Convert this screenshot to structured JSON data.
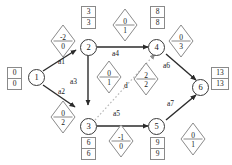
{
  "diagram": {
    "type": "activity-network",
    "nodes": [
      {
        "id": "n1",
        "label": "1",
        "x": 28,
        "y": 77
      },
      {
        "id": "n2",
        "label": "2",
        "x": 80,
        "y": 39
      },
      {
        "id": "n3",
        "label": "3",
        "x": 80,
        "y": 118
      },
      {
        "id": "n4",
        "label": "4",
        "x": 152,
        "y": 39
      },
      {
        "id": "n5",
        "label": "5",
        "x": 152,
        "y": 118
      },
      {
        "id": "n6",
        "label": "6",
        "x": 196,
        "y": 78
      }
    ],
    "time_boxes": [
      {
        "for": "n1",
        "early": "0",
        "late": "0",
        "x": 7,
        "y": 72
      },
      {
        "for": "n2",
        "early": "3",
        "late": "3",
        "x": 82,
        "y": 8
      },
      {
        "for": "n4",
        "early": "8",
        "late": "8",
        "x": 152,
        "y": 8
      },
      {
        "for": "n6",
        "early": "13",
        "late": "13",
        "x": 213,
        "y": 72
      },
      {
        "for": "n3",
        "early": "6",
        "late": "6",
        "x": 82,
        "y": 137
      },
      {
        "for": "n5",
        "early": "9",
        "late": "9",
        "x": 152,
        "y": 137
      }
    ],
    "edges": [
      {
        "id": "a1",
        "from": "n1",
        "to": "n2",
        "label": "a1",
        "label_x": 58,
        "label_y": 63,
        "style": "solid"
      },
      {
        "id": "a2",
        "from": "n1",
        "to": "n3",
        "label": "a2",
        "label_x": 58,
        "label_y": 92,
        "style": "solid"
      },
      {
        "id": "a3",
        "from": "n2",
        "to": "n3",
        "label": "a3",
        "label_x": 72,
        "label_y": 81,
        "style": "solid"
      },
      {
        "id": "a4",
        "from": "n2",
        "to": "n4",
        "label": "a4",
        "label_x": 112,
        "label_y": 53,
        "style": "solid"
      },
      {
        "id": "a5",
        "from": "n3",
        "to": "n5",
        "label": "a5",
        "label_x": 113,
        "label_y": 112,
        "style": "solid"
      },
      {
        "id": "a6",
        "from": "n4",
        "to": "n6",
        "label": "a6",
        "label_x": 164,
        "label_y": 65,
        "style": "solid"
      },
      {
        "id": "a7",
        "from": "n5",
        "to": "n6",
        "label": "a7",
        "label_x": 168,
        "label_y": 100,
        "style": "solid"
      },
      {
        "id": "d",
        "from": "n3",
        "to": "n4",
        "label": "d",
        "label_x": 117,
        "label_y": 85,
        "style": "dotted"
      }
    ],
    "float_diamonds": [
      {
        "for": "a1",
        "num": "-2",
        "den": "0",
        "x": 50,
        "y": 24
      },
      {
        "for": "a4",
        "num": "0",
        "den": "1",
        "x": 112,
        "y": 8
      },
      {
        "for": "a6",
        "num": "0",
        "den": "3",
        "x": 168,
        "y": 24
      },
      {
        "for": "a3",
        "num": "0",
        "den": "1",
        "x": 96,
        "y": 60
      },
      {
        "for": "d",
        "num": "2",
        "den": "2",
        "x": 133,
        "y": 62
      },
      {
        "for": "a2",
        "num": "0",
        "den": "2",
        "x": 50,
        "y": 100
      },
      {
        "for": "a5",
        "num": "-1",
        "den": "0",
        "x": 108,
        "y": 124
      },
      {
        "for": "a7",
        "num": "0",
        "den": "1",
        "x": 180,
        "y": 122
      }
    ],
    "colors": {
      "stroke": "#3a3a3a",
      "box_stroke": "#8a8a8a",
      "diamond_stroke": "#8a8a8a",
      "dotted": "#b0b0b0",
      "background": "#ffffff"
    }
  }
}
